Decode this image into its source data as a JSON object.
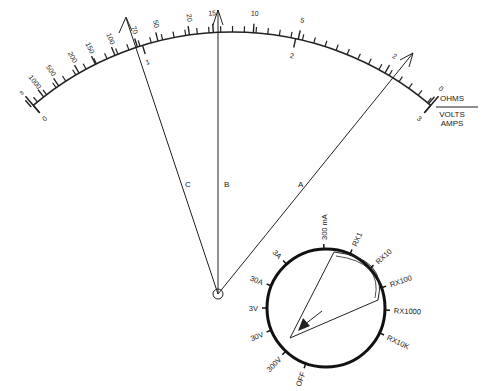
{
  "scale": {
    "ohms_label": "OHMS",
    "volts_label": "VOLTS",
    "amps_label": "AMPS",
    "ohms_ticks": [
      "∞",
      "1000",
      "500",
      "200",
      "150",
      "100",
      "70",
      "50",
      "20",
      "15",
      "10",
      "5",
      "2",
      "0"
    ],
    "volts_ticks": [
      "0",
      "1",
      "2",
      "3"
    ]
  },
  "pointers": [
    {
      "label": "C"
    },
    {
      "label": "B"
    },
    {
      "label": "A"
    }
  ],
  "selector": {
    "positions": [
      "OFF",
      "300V",
      "30V",
      "3V",
      "30A",
      "3A",
      "300 mA",
      "RX1",
      "RX10",
      "RX100",
      "RX1000",
      "RX10K"
    ]
  },
  "colors": {
    "ink": "#222222",
    "background": "#ffffff"
  }
}
